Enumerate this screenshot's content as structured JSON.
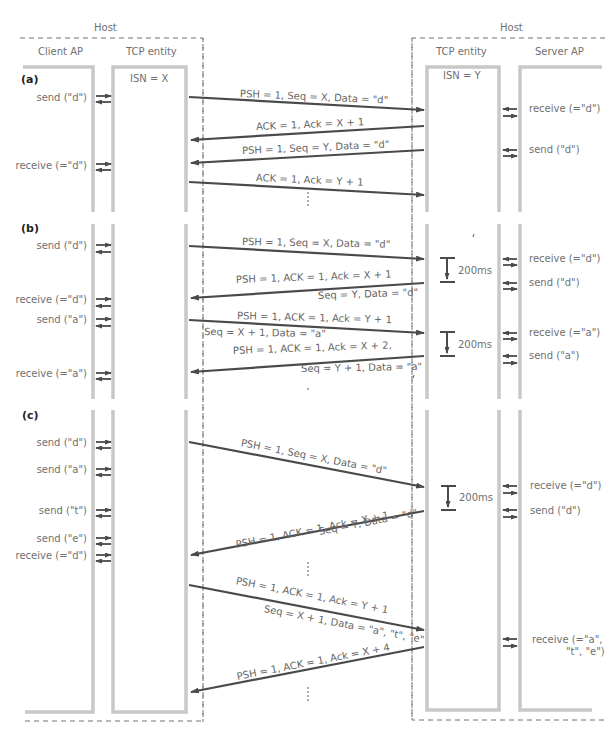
{
  "header": {
    "left_host": "Host",
    "right_host": "Host",
    "client_ap": "Client AP",
    "tcp_entity_left": "TCP entity",
    "tcp_entity_right": "TCP entity",
    "server_ap": "Server AP"
  },
  "panels": {
    "a": {
      "tag": "(a)",
      "isn_client": "ISN = X",
      "isn_server": "ISN = Y",
      "client_events": [
        "send (\"d\")",
        "receive (=\"d\")"
      ],
      "server_events": [
        "receive (=\"d\")",
        "send (\"d\")"
      ],
      "messages": [
        "PSH = 1, Seq = X, Data = \"d\"",
        "ACK = 1, Ack = X + 1",
        "PSH = 1, Seq = Y, Data = \"d\"",
        "ACK = 1, Ack = Y + 1"
      ]
    },
    "b": {
      "tag": "(b)",
      "client_events": [
        "send (\"d\")",
        "receive (=\"d\")",
        "send (\"a\")",
        "receive (=\"a\")"
      ],
      "server_events": [
        "receive (=\"d\")",
        "send (\"d\")",
        "receive (=\"a\")",
        "send (\"a\")"
      ],
      "timers": [
        "200ms",
        "200ms"
      ],
      "messages": [
        "PSH = 1, Seq = X, Data = \"d\"",
        "PSH = 1, ACK = 1, Ack = X + 1",
        "Seq = Y, Data = \"d\"",
        "PSH = 1, ACK = 1, Ack = Y + 1",
        "Seq = X + 1, Data = \"a\"",
        "PSH = 1, ACK = 1, Ack = X + 2,",
        "Seq = Y + 1, Data = \"a\""
      ]
    },
    "c": {
      "tag": "(c)",
      "client_events": [
        "send (\"d\")",
        "send (\"a\")",
        "send (\"t\")",
        "send (\"e\")",
        "receive (=\"d\")"
      ],
      "server_events": [
        "receive (=\"d\")",
        "send (\"d\")",
        "receive (=\"a\",",
        "\"t\", \"e\")"
      ],
      "timers": [
        "200ms"
      ],
      "messages": [
        "PSH = 1, Seq = X, Data = \"d\"",
        "PSH = 1, ACK = 1, Ack = X + 1",
        "Seq = Y, Data = \"d\"",
        "PSH = 1, ACK = 1, Ack = Y + 1",
        "Seq = X + 1, Data = \"a\", \"t\", \"e\"",
        "PSH = 1, ACK = 1, Ack = X + 4"
      ]
    }
  },
  "colors": {
    "column_wall": "#c8c8c8",
    "arrow": "#4a4a4a",
    "dashed": "#666666",
    "text": "#6e6e6e"
  }
}
